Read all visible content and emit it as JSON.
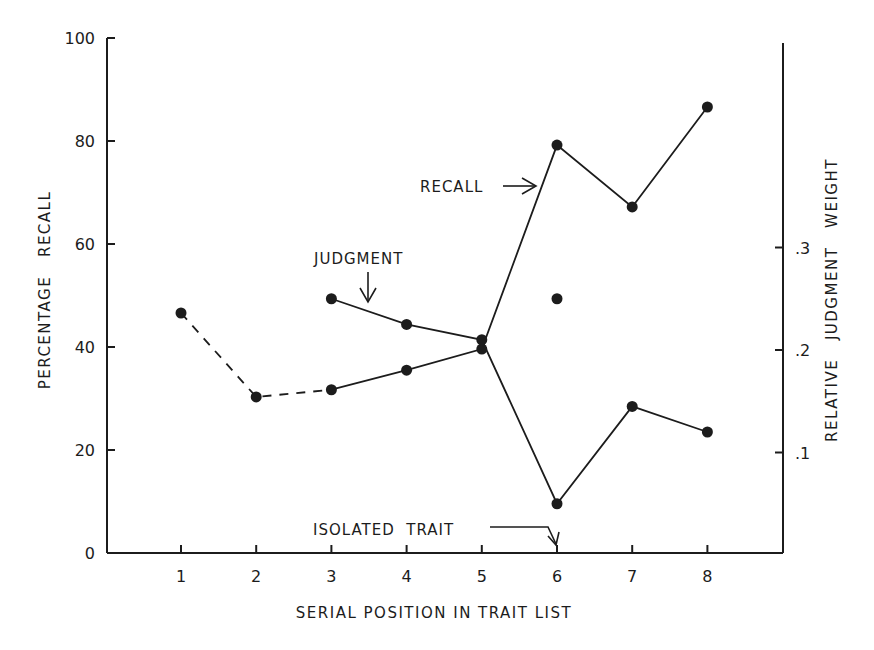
{
  "chart_data": {
    "type": "line",
    "title": "",
    "xlabel": "SERIAL POSITION IN TRAIT LIST",
    "ylabel": "PERCENTAGE RECALL",
    "ylabel_right": "RELATIVE JUDGMENT WEIGHT",
    "x": [
      1,
      2,
      3,
      4,
      5,
      6,
      7,
      8
    ],
    "x_tick_labels": [
      "1",
      "2",
      "3",
      "4",
      "5",
      "6",
      "7",
      "8"
    ],
    "ylim": [
      0,
      100
    ],
    "y_ticks": [
      0,
      20,
      40,
      60,
      80,
      100
    ],
    "y_tick_labels": [
      "0",
      "20",
      "40",
      "60",
      "80",
      "100"
    ],
    "ylim_right": [
      0,
      0.5
    ],
    "y_right_ticks": [
      0.1,
      0.2,
      0.3
    ],
    "y_right_tick_labels": [
      ".1",
      ".2",
      ".3"
    ],
    "grid": false,
    "legend": "none (inline annotations)",
    "series": [
      {
        "name": "RECALL",
        "axis": "left",
        "x": [
          1,
          2,
          3,
          4,
          5,
          6,
          7,
          8
        ],
        "values": [
          46.6,
          30.3,
          31.7,
          35.5,
          39.6,
          79.2,
          67.2,
          86.6
        ],
        "line_style": "dashed for positions 1-3, solid thereafter"
      },
      {
        "name": "JUDGMENT",
        "axis": "right",
        "x": [
          3,
          4,
          5,
          6,
          7,
          8
        ],
        "values": [
          0.25,
          0.225,
          0.21,
          0.05,
          0.145,
          0.12
        ],
        "line_style": "solid"
      },
      {
        "name": "Isolated point",
        "axis": "right",
        "x": [
          6
        ],
        "values": [
          0.25
        ],
        "line_style": "none (unconnected point)"
      }
    ],
    "annotations": [
      {
        "text": "RECALL",
        "arrow": "right",
        "points_to": "recall line between positions 5 and 6"
      },
      {
        "text": "JUDGMENT",
        "arrow": "down",
        "points_to": "judgment line between positions 3 and 4"
      },
      {
        "text": "ISOLATED TRAIT",
        "arrow": "down",
        "points_to": "serial position 6"
      }
    ]
  },
  "labels": {
    "xlabel": "SERIAL POSITION IN TRAIT LIST",
    "ylabel_left": "PERCENTAGE   RECALL",
    "ylabel_right": "RELATIVE   JUDGMENT   WEIGHT",
    "annot_recall": "RECALL",
    "annot_judgment": "JUDGMENT",
    "annot_isolated": "ISOLATED  TRAIT"
  },
  "colors": {
    "ink": "#1c1c1c",
    "background": "#ffffff"
  }
}
